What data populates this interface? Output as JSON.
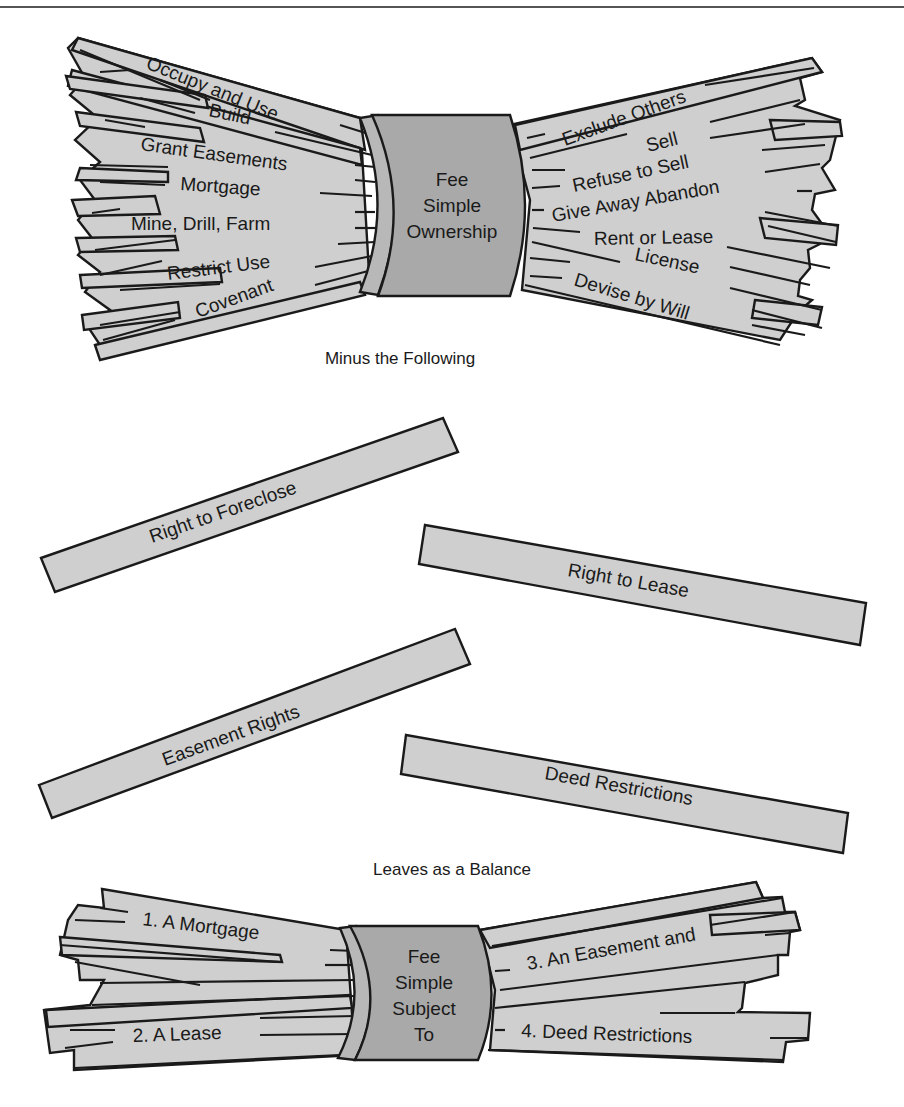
{
  "top_bundle": {
    "center_label": [
      "Fee",
      "Simple",
      "Ownership"
    ],
    "left_sticks": [
      "Occupy and Use",
      "Build",
      "Grant Easements",
      "Mortgage",
      "Mine, Drill, Farm",
      "Restrict Use",
      "Covenant"
    ],
    "right_sticks": [
      "Exclude Others",
      "Sell",
      "Refuse to Sell",
      "Give Away Abandon",
      "Rent or Lease",
      "License",
      "Devise by Will"
    ]
  },
  "caption_minus": "Minus the Following",
  "removed_sticks": [
    "Right to Foreclose",
    "Right to Lease",
    "Easement Rights",
    "Deed Restrictions"
  ],
  "caption_balance": "Leaves as a Balance",
  "bottom_bundle": {
    "center_label": [
      "Fee",
      "Simple",
      "Subject",
      "To"
    ],
    "left_sticks": [
      "1. A Mortgage",
      "2. A Lease"
    ],
    "right_sticks": [
      "3. An Easement and",
      "4. Deed Restrictions"
    ]
  },
  "colors": {
    "stick_fill": "#cfcfcf",
    "band_fill": "#a9a9a9",
    "outline": "#1a1a1a",
    "background": "#ffffff"
  }
}
